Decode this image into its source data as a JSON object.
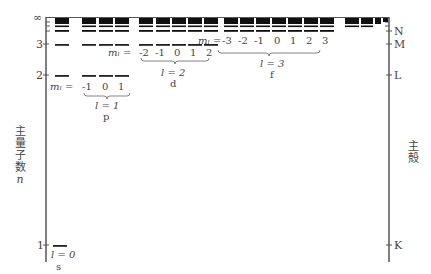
{
  "diagram": {
    "left_axis": {
      "label": [
        "主",
        "量",
        "子",
        "数"
      ],
      "symbol": "n",
      "ticks": [
        {
          "label": "∞",
          "y": 18
        },
        {
          "label": "3",
          "y": 44
        },
        {
          "label": "2",
          "y": 75
        },
        {
          "label": "1",
          "y": 245
        }
      ]
    },
    "right_axis": {
      "label": [
        "主",
        "殻"
      ],
      "ticks": [
        {
          "label": "N",
          "y": 31
        },
        {
          "label": "M",
          "y": 44
        },
        {
          "label": "L",
          "y": 75
        },
        {
          "label": "K",
          "y": 245
        }
      ]
    },
    "groups": [
      {
        "l_label": "l = 0",
        "orbital": "s",
        "ml_prefix": "",
        "ml_values": []
      },
      {
        "l_label": "l = 1",
        "orbital": "p",
        "ml_prefix": "mₗ =",
        "ml_values": [
          "-1",
          "0",
          "1"
        ]
      },
      {
        "l_label": "l = 2",
        "orbital": "d",
        "ml_prefix": "mₗ =",
        "ml_values": [
          "-2",
          "-1",
          "0",
          "1",
          "2"
        ]
      },
      {
        "l_label": "l = 3",
        "orbital": "f",
        "ml_prefix": "mₗ =",
        "ml_values": [
          "-3",
          "-2",
          "-1",
          "0",
          "1",
          "2",
          "3"
        ]
      }
    ],
    "s_label": {
      "l": "l = 0",
      "orbital": "s"
    },
    "p_label": {
      "ml": "mₗ =",
      "m1": "-1",
      "m2": "0",
      "m3": "1",
      "l": "l = 1",
      "orbital": "p"
    },
    "d_label": {
      "ml": "mₗ =",
      "m1": "-2",
      "m2": "-1",
      "m3": "0",
      "m4": "1",
      "m5": "2",
      "l": "l = 2",
      "orbital": "d"
    },
    "f_label": {
      "ml": "mₗ =",
      "m1": "-3",
      "m2": "-2",
      "m3": "-1",
      "m4": "0",
      "m5": "1",
      "m6": "2",
      "m7": "3",
      "l": "l = 3",
      "orbital": "f"
    },
    "left_ticks": {
      "inf": "∞",
      "n3": "3",
      "n2": "2",
      "n1": "1"
    },
    "right_ticks": {
      "N": "N",
      "M": "M",
      "L": "L",
      "K": "K"
    },
    "left_axis_label": {
      "c1": "主",
      "c2": "量",
      "c3": "子",
      "c4": "数",
      "sym": "n"
    },
    "right_axis_label": {
      "c1": "主",
      "c2": "殻"
    }
  }
}
